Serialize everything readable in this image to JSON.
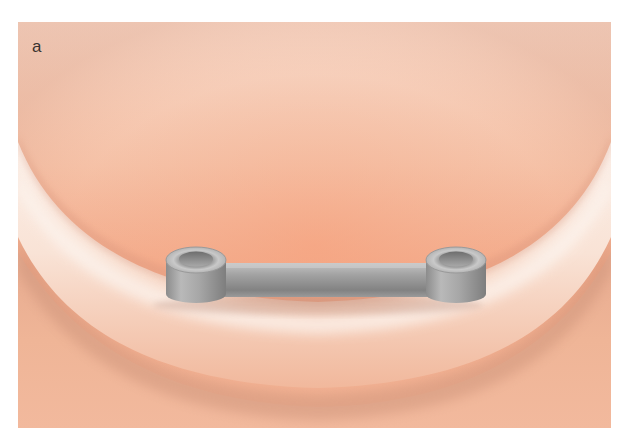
{
  "figure": {
    "panel_label": "a",
    "colors": {
      "background": "#ffffff",
      "tissue_light": "#fbeee6",
      "tissue_mid": "#f3c2a8",
      "tissue_deep": "#f0a482",
      "tissue_shadow": "#d9a58c",
      "metal_light": "#c8c8c8",
      "metal_mid": "#a3a3a3",
      "metal_dark": "#7d7d7d"
    },
    "components": {
      "left_sleeve": "cylinder-sleeve",
      "right_sleeve": "cylinder-sleeve",
      "connector": "horizontal-bar"
    }
  }
}
